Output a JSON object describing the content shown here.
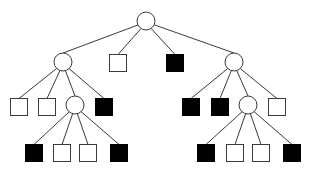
{
  "diagram": {
    "type": "tree",
    "colors": {
      "background": "#ffffff",
      "edge": "#3a3a3a",
      "filled_leaf": "#000000",
      "empty_leaf": "#ffffff"
    },
    "circle_radius": 9,
    "square_size": 17,
    "nodes": [
      {
        "id": "root",
        "shape": "circle",
        "x": 146,
        "y": 21
      },
      {
        "id": "l1",
        "shape": "circle",
        "x": 63,
        "y": 62,
        "parent": "root"
      },
      {
        "id": "m1",
        "shape": "square",
        "fill": "white",
        "x": 118,
        "y": 63,
        "parent": "root"
      },
      {
        "id": "m2",
        "shape": "square",
        "fill": "black",
        "x": 175,
        "y": 63,
        "parent": "root"
      },
      {
        "id": "r1",
        "shape": "circle",
        "x": 234,
        "y": 62,
        "parent": "root"
      },
      {
        "id": "l1a",
        "shape": "square",
        "fill": "white",
        "x": 19,
        "y": 107,
        "parent": "l1"
      },
      {
        "id": "l1b",
        "shape": "square",
        "fill": "white",
        "x": 47,
        "y": 107,
        "parent": "l1"
      },
      {
        "id": "l2",
        "shape": "circle",
        "x": 75,
        "y": 105,
        "parent": "l1"
      },
      {
        "id": "l1d",
        "shape": "square",
        "fill": "black",
        "x": 104,
        "y": 107,
        "parent": "l1"
      },
      {
        "id": "l2a",
        "shape": "square",
        "fill": "black",
        "x": 34,
        "y": 153,
        "parent": "l2"
      },
      {
        "id": "l2b",
        "shape": "square",
        "fill": "white",
        "x": 62,
        "y": 153,
        "parent": "l2"
      },
      {
        "id": "l2c",
        "shape": "square",
        "fill": "white",
        "x": 88,
        "y": 153,
        "parent": "l2"
      },
      {
        "id": "l2d",
        "shape": "square",
        "fill": "black",
        "x": 119,
        "y": 153,
        "parent": "l2"
      },
      {
        "id": "r1a",
        "shape": "square",
        "fill": "black",
        "x": 191,
        "y": 107,
        "parent": "r1"
      },
      {
        "id": "r1b",
        "shape": "square",
        "fill": "black",
        "x": 220,
        "y": 107,
        "parent": "r1"
      },
      {
        "id": "r2",
        "shape": "circle",
        "x": 248,
        "y": 105,
        "parent": "r1"
      },
      {
        "id": "r1d",
        "shape": "square",
        "fill": "white",
        "x": 277,
        "y": 107,
        "parent": "r1"
      },
      {
        "id": "r2a",
        "shape": "square",
        "fill": "black",
        "x": 206,
        "y": 153,
        "parent": "r2"
      },
      {
        "id": "r2b",
        "shape": "square",
        "fill": "white",
        "x": 235,
        "y": 153,
        "parent": "r2"
      },
      {
        "id": "r2c",
        "shape": "square",
        "fill": "white",
        "x": 261,
        "y": 153,
        "parent": "r2"
      },
      {
        "id": "r2d",
        "shape": "square",
        "fill": "black",
        "x": 292,
        "y": 153,
        "parent": "r2"
      }
    ]
  }
}
